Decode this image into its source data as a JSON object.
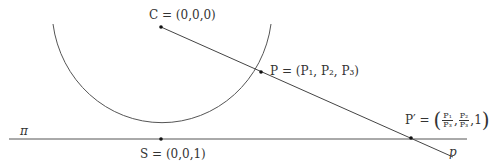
{
  "diagram": {
    "colors": {
      "stroke": "#333333",
      "text": "#333333",
      "background": "#ffffff"
    },
    "labels": {
      "C": "C = (0,0,0)",
      "P": "P = (P₁, P₂, P₃)",
      "S": "S = (0,0,1)",
      "plane": "π",
      "line": "p",
      "P_prime_prefix": "P′ =",
      "P_prime_frac1_num": "P₁",
      "P_prime_frac1_den": "P₃",
      "P_prime_frac2_num": "P₂",
      "P_prime_frac2_den": "P₃",
      "P_prime_last": "1",
      "open_paren": "(",
      "close_paren": ")",
      "comma": ","
    },
    "points": {
      "C": [
        161,
        27
      ],
      "P": [
        261,
        75
      ],
      "S": [
        161,
        139
      ],
      "P_prime": [
        411,
        138
      ]
    },
    "shapes": {
      "semicircle": {
        "cx": 161,
        "cy": 27,
        "r": 112
      },
      "plane_line": {
        "x1": 9,
        "y1": 139,
        "x2": 467,
        "y2": 139
      },
      "ray_p": {
        "x1": 161,
        "y1": 27,
        "x2": 453,
        "y2": 157
      }
    }
  }
}
